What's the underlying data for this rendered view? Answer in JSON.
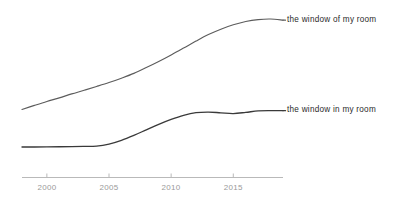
{
  "chart_data": {
    "type": "line",
    "title": "",
    "subtitle": "",
    "xlabel": "",
    "ylabel": "",
    "xlim": [
      1998,
      2019
    ],
    "ylim": [
      0,
      1
    ],
    "grid": false,
    "legend_position": "inline-right-of-line-end",
    "x_tick_labels": [
      "2000",
      "2005",
      "2010",
      "2015"
    ],
    "x_ticks": [
      2000,
      2005,
      2010,
      2015
    ],
    "axis_color": "#b9b9b9",
    "tick_label_color": "#9a9a9a",
    "label_text_color": "#2b2b2b",
    "background_color": "#ffffff",
    "x": [
      1998,
      1999,
      2000,
      2001,
      2002,
      2003,
      2004,
      2005,
      2006,
      2007,
      2008,
      2009,
      2010,
      2011,
      2012,
      2013,
      2014,
      2015,
      2016,
      2017,
      2018,
      2019
    ],
    "series": [
      {
        "name": "the window of my room",
        "color": "#5c5c5c",
        "values": [
          0.33,
          0.358,
          0.385,
          0.41,
          0.437,
          0.462,
          0.488,
          0.515,
          0.545,
          0.578,
          0.618,
          0.66,
          0.705,
          0.752,
          0.8,
          0.845,
          0.882,
          0.912,
          0.935,
          0.948,
          0.952,
          0.944
        ]
      },
      {
        "name": "the window in my room",
        "color": "#3a3a3a",
        "values": [
          0.072,
          0.072,
          0.073,
          0.074,
          0.075,
          0.076,
          0.078,
          0.092,
          0.118,
          0.152,
          0.19,
          0.228,
          0.262,
          0.29,
          0.308,
          0.312,
          0.307,
          0.302,
          0.31,
          0.32,
          0.322,
          0.322
        ]
      }
    ]
  }
}
